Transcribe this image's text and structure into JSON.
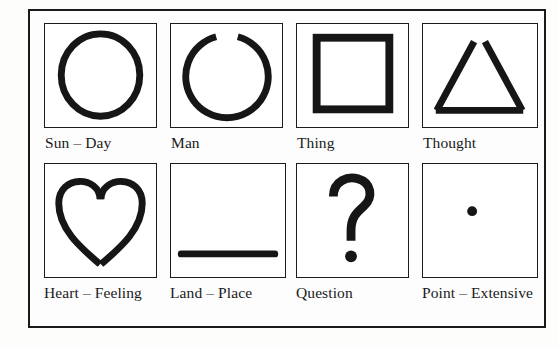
{
  "figure": {
    "background_color": "#fdfdfc",
    "ink_color": "#161616",
    "border_color": "#1a1a1a",
    "rows": 2,
    "columns": 4,
    "cells": [
      {
        "id": "sun-day",
        "symbol": "circle-icon",
        "symbol_description": "closed circle outline",
        "caption": "Sun – Day",
        "row": 1,
        "column": 1
      },
      {
        "id": "man",
        "symbol": "open-circle-icon",
        "symbol_description": "circle outline with a gap at the top",
        "caption": "Man",
        "row": 1,
        "column": 2
      },
      {
        "id": "thing",
        "symbol": "square-icon",
        "symbol_description": "closed square outline",
        "caption": "Thing",
        "row": 1,
        "column": 3
      },
      {
        "id": "thought",
        "symbol": "open-triangle-icon",
        "symbol_description": "triangle with an open apex",
        "caption": "Thought",
        "row": 1,
        "column": 4
      },
      {
        "id": "heart-feeling",
        "symbol": "heart-icon",
        "symbol_description": "heart outline with open lobes at the top",
        "caption": "Heart – Feeling",
        "row": 2,
        "column": 1
      },
      {
        "id": "land-place",
        "symbol": "horizontal-bar-icon",
        "symbol_description": "thick horizontal line near the bottom",
        "caption": "Land – Place",
        "row": 2,
        "column": 2
      },
      {
        "id": "question",
        "symbol": "question-mark-icon",
        "symbol_description": "question mark glyph",
        "caption": "Question",
        "row": 2,
        "column": 3
      },
      {
        "id": "point-extensive",
        "symbol": "dot-icon",
        "symbol_description": "small filled dot at the centre",
        "caption": "Point – Extensive",
        "row": 2,
        "column": 4
      }
    ]
  }
}
